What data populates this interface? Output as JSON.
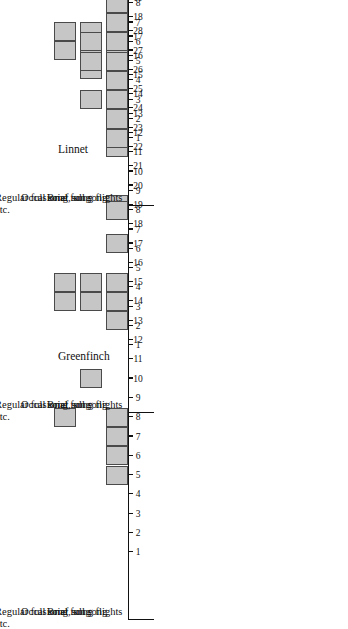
{
  "figure": {
    "title": "",
    "bar_fill_color": "#c6c6c6",
    "bar_edge_color": "#4a4a4a",
    "axis_color": "#111111",
    "background_color": "#ffffff"
  },
  "panels": [
    {
      "id": "greenfinch",
      "title": "Greenfinch"
    },
    {
      "id": "linnet",
      "title": "Linnet"
    },
    {
      "id": "chaffinch",
      "title": "Chaffinch"
    }
  ],
  "categories": [
    "Regular full song, song\nflights etc.",
    "Occasional full song",
    "Brief song"
  ],
  "axis": {
    "tick_labels": [
      "1",
      "2",
      "3",
      "4",
      "5",
      "6",
      "7",
      "8",
      "9",
      "10",
      "11",
      "12",
      "13",
      "14",
      "15",
      "16",
      "17",
      "18",
      "19",
      "20",
      "21",
      "22",
      "23",
      "24",
      "25",
      "26",
      "27",
      "28"
    ],
    "min": 1,
    "max": 28
  },
  "chart_data": {
    "type": "bar",
    "xlabel": "Week",
    "ylabel": "Song category",
    "x": [
      1,
      2,
      3,
      4,
      5,
      6,
      7,
      8,
      9,
      10,
      11,
      12,
      13,
      14,
      15,
      16,
      17,
      18,
      19,
      20,
      21,
      22,
      23,
      24,
      25,
      26,
      27,
      28
    ],
    "xlim": [
      1,
      28
    ],
    "grid": false,
    "legend": "none",
    "categories": [
      "Regular full song, song flights etc.",
      "Occasional full song",
      "Brief song"
    ],
    "panels": [
      {
        "name": "Greenfinch",
        "series": [
          {
            "name": "Regular full song, song flights etc.",
            "weeks_present": [
              8,
              14,
              15,
              27,
              28
            ],
            "values": [
              0,
              0,
              0,
              0,
              0,
              0,
              0,
              1,
              0,
              0,
              0,
              0,
              0,
              1,
              1,
              0,
              0,
              0,
              0,
              0,
              0,
              0,
              0,
              0,
              0,
              0,
              1,
              1
            ]
          },
          {
            "name": "Occasional full song",
            "weeks_present": [
              10,
              14,
              15,
              26,
              27,
              28
            ],
            "values": [
              0,
              0,
              0,
              0,
              0,
              0,
              0,
              0,
              0,
              1,
              0,
              0,
              0,
              1,
              1,
              0,
              0,
              0,
              0,
              0,
              0,
              0,
              0,
              0,
              0,
              1,
              1,
              1
            ]
          },
          {
            "name": "Brief song",
            "weeks_present": [
              5,
              6,
              7,
              8,
              13,
              14,
              15,
              17,
              19,
              22,
              25,
              26,
              27,
              28
            ],
            "values": [
              0,
              0,
              0,
              0,
              1,
              1,
              1,
              1,
              0,
              0,
              0,
              0,
              1,
              1,
              1,
              0,
              1,
              0,
              1,
              0,
              0,
              1,
              0,
              0,
              1,
              1,
              1,
              1
            ]
          }
        ]
      },
      {
        "name": "Linnet",
        "series": [
          {
            "name": "Regular full song, song flights etc.",
            "weeks_present": [],
            "values": [
              0,
              0,
              0,
              0,
              0,
              0,
              0,
              0,
              0,
              0,
              0,
              0,
              0,
              0,
              0,
              0,
              0,
              0,
              0,
              0,
              0,
              0,
              0,
              0,
              0,
              0,
              0,
              0
            ]
          },
          {
            "name": "Occasional full song",
            "weeks_present": [
              27
            ],
            "values": [
              0,
              0,
              0,
              0,
              0,
              0,
              0,
              0,
              0,
              0,
              0,
              0,
              0,
              0,
              0,
              0,
              0,
              0,
              0,
              0,
              0,
              0,
              0,
              0,
              0,
              0,
              1,
              0
            ]
          },
          {
            "name": "Brief song",
            "weeks_present": [
              8,
              14,
              15,
              25,
              26,
              27,
              28
            ],
            "values": [
              0,
              0,
              0,
              0,
              0,
              0,
              0,
              1,
              0,
              0,
              0,
              0,
              0,
              1,
              1,
              0,
              0,
              0,
              0,
              0,
              0,
              0,
              0,
              0,
              1,
              1,
              1,
              1
            ]
          }
        ]
      },
      {
        "name": "Chaffinch",
        "series": [
          {
            "name": "Regular full song, song flights etc.",
            "weeks_present": [
              25,
              27,
              28
            ],
            "values": [
              0,
              0,
              0,
              0,
              0,
              0,
              0,
              0,
              0,
              0,
              0,
              0,
              0,
              0,
              0,
              0,
              0,
              0,
              0,
              0,
              0,
              0,
              0,
              0,
              1,
              0,
              1,
              1
            ]
          },
          {
            "name": "Occasional full song",
            "weeks_present": [
              3,
              5,
              6,
              9,
              13,
              15,
              25,
              26,
              27,
              28
            ],
            "values": [
              0,
              0,
              1,
              0,
              1,
              1,
              0,
              0,
              1,
              0,
              0,
              0,
              1,
              0,
              1,
              0,
              0,
              0,
              0,
              0,
              0,
              0,
              0,
              0,
              1,
              1,
              1,
              1
            ]
          },
          {
            "name": "Brief song",
            "weeks_present": [
              1,
              2,
              3,
              4,
              5,
              6,
              7,
              8,
              9,
              11,
              12,
              13,
              14,
              15,
              16,
              20,
              24,
              25,
              26,
              27,
              28
            ],
            "values": [
              1,
              1,
              1,
              1,
              1,
              1,
              1,
              1,
              1,
              0,
              1,
              1,
              1,
              1,
              1,
              1,
              0,
              0,
              0,
              1,
              0,
              0,
              0,
              1,
              1,
              1,
              1,
              1
            ]
          }
        ]
      }
    ]
  }
}
